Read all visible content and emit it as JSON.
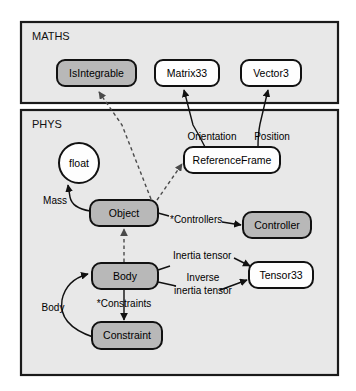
{
  "diagram": {
    "type": "uml-class-diagram",
    "background_color": "#ffffff",
    "packages": [
      {
        "id": "maths",
        "label": "MATHS",
        "fill_color": "#e8e8e8",
        "stroke_color": "#1a1a1a"
      },
      {
        "id": "phys",
        "label": "PHYS",
        "fill_color": "#e8e8e8",
        "stroke_color": "#1a1a1a"
      }
    ],
    "nodes": [
      {
        "id": "isintegrable",
        "label": "IsIntegrable",
        "shape": "rounded-rect",
        "fill": "gray",
        "package": "maths"
      },
      {
        "id": "matrix33",
        "label": "Matrix33",
        "shape": "rounded-rect",
        "fill": "white",
        "package": "maths"
      },
      {
        "id": "vector3",
        "label": "Vector3",
        "shape": "rounded-rect",
        "fill": "white",
        "package": "maths"
      },
      {
        "id": "float",
        "label": "float",
        "shape": "circle",
        "fill": "white",
        "package": "phys"
      },
      {
        "id": "referenceframe",
        "label": "ReferenceFrame",
        "shape": "rounded-rect",
        "fill": "white",
        "package": "phys"
      },
      {
        "id": "object",
        "label": "Object",
        "shape": "rounded-rect",
        "fill": "gray",
        "package": "phys"
      },
      {
        "id": "controller",
        "label": "Controller",
        "shape": "rounded-rect",
        "fill": "gray",
        "package": "phys"
      },
      {
        "id": "body",
        "label": "Body",
        "shape": "rounded-rect",
        "fill": "gray",
        "package": "phys"
      },
      {
        "id": "tensor33",
        "label": "Tensor33",
        "shape": "rounded-rect",
        "fill": "white",
        "package": "phys"
      },
      {
        "id": "constraint",
        "label": "Constraint",
        "shape": "rounded-rect",
        "fill": "gray",
        "package": "phys"
      }
    ],
    "edges": [
      {
        "id": "object-isintegrable",
        "from": "object",
        "to": "isintegrable",
        "style": "dashed",
        "label": ""
      },
      {
        "id": "object-referenceframe",
        "from": "object",
        "to": "referenceframe",
        "style": "dashed",
        "label": ""
      },
      {
        "id": "referenceframe-matrix33",
        "from": "referenceframe",
        "to": "matrix33",
        "style": "solid",
        "label": "Orientation"
      },
      {
        "id": "referenceframe-vector3",
        "from": "referenceframe",
        "to": "vector3",
        "style": "solid",
        "label": "Position"
      },
      {
        "id": "object-float",
        "from": "object",
        "to": "float",
        "style": "solid",
        "label": "Mass"
      },
      {
        "id": "object-controller",
        "from": "object",
        "to": "controller",
        "style": "solid",
        "label": "*Controllers"
      },
      {
        "id": "body-object",
        "from": "body",
        "to": "object",
        "style": "dashed",
        "label": ""
      },
      {
        "id": "body-tensor33-inertia",
        "from": "body",
        "to": "tensor33",
        "style": "solid",
        "label": "Inertia tensor"
      },
      {
        "id": "body-tensor33-inverse",
        "from": "body",
        "to": "tensor33",
        "style": "solid",
        "label_line1": "Inverse",
        "label_line2": "inertia tensor"
      },
      {
        "id": "body-constraint",
        "from": "body",
        "to": "constraint",
        "style": "solid",
        "label": "*Constraints"
      },
      {
        "id": "constraint-body",
        "from": "constraint",
        "to": "body",
        "style": "solid",
        "label": "Body"
      }
    ],
    "labels": {
      "maths_pkg": "MATHS",
      "phys_pkg": "PHYS",
      "isintegrable": "IsIntegrable",
      "matrix33": "Matrix33",
      "vector3": "Vector3",
      "float": "float",
      "referenceframe": "ReferenceFrame",
      "object": "Object",
      "controller": "Controller",
      "body": "Body",
      "tensor33": "Tensor33",
      "constraint": "Constraint",
      "orientation": "Orientation",
      "position": "Position",
      "mass": "Mass",
      "controllers": "*Controllers",
      "inertia_tensor": "Inertia tensor",
      "inverse_line1": "Inverse",
      "inverse_line2": "inertia tensor",
      "constraints": "*Constraints",
      "body_assoc": "Body"
    }
  }
}
